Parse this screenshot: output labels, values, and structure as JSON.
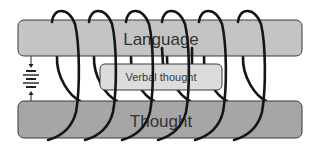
{
  "diagram": {
    "title": "",
    "colors": {
      "background": "#ffffff",
      "language_bar": "#c4c4c4",
      "thought_bar": "#a6a6a6",
      "verbal_box": "#dcdcdc",
      "outline": "#3a3a3a",
      "coil": "#151515"
    },
    "nodes": [
      {
        "id": "language",
        "label": "Language",
        "shape": "rounded-bar",
        "position": "top"
      },
      {
        "id": "verbal_thought",
        "label": "Verbal thought",
        "shape": "rounded-box",
        "position": "middle"
      },
      {
        "id": "thought",
        "label": "Thought",
        "shape": "rounded-bar",
        "position": "bottom"
      }
    ],
    "components": [
      {
        "id": "battery",
        "type": "battery-symbol",
        "position": "left",
        "connects": [
          "language",
          "thought"
        ]
      },
      {
        "id": "coil",
        "type": "helical-coil",
        "turns": 6,
        "wraps": [
          "language",
          "verbal_thought",
          "thought"
        ]
      }
    ],
    "labels": {
      "language": "Language",
      "verbal_thought": "Verbal thought",
      "thought": "Thought"
    }
  }
}
